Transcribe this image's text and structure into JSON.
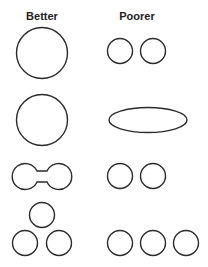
{
  "headers": {
    "better": "Better",
    "poorer": "Poorer"
  },
  "rows": [
    {
      "better": "single large circle",
      "poorer": "two small separate circles"
    },
    {
      "better": "single large circle",
      "poorer": "elongated ellipse"
    },
    {
      "better": "two circles joined by a neck (dumbbell)",
      "poorer": "two small separate circles"
    },
    {
      "better": "three circles in a triangle cluster",
      "poorer": "three circles in a row"
    }
  ],
  "colors": {
    "stroke": "#2a2a2a",
    "background": "#ffffff"
  }
}
